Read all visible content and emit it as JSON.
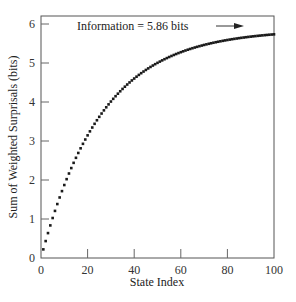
{
  "chart_data": {
    "type": "scatter",
    "title": "",
    "xlabel": "State Index",
    "ylabel": "Sum of Weighted Surprisals (bits)",
    "xlim": [
      0,
      100
    ],
    "ylim": [
      0,
      6.2
    ],
    "xticks": [
      0,
      20,
      40,
      60,
      80,
      100
    ],
    "yticks": [
      0,
      1,
      2,
      3,
      4,
      5,
      6
    ],
    "grid": false,
    "legend": null,
    "annotation": {
      "text": "Information = 5.86 bits",
      "arrow_to": [
        86,
        5.86
      ]
    },
    "series": [
      {
        "name": "cumulative weighted surprisal",
        "model": "5.86*(1-exp(-x/26))",
        "x": [
          1,
          2,
          3,
          4,
          5,
          6,
          7,
          8,
          9,
          10,
          12,
          14,
          16,
          18,
          20,
          25,
          30,
          35,
          40,
          45,
          50,
          55,
          60,
          65,
          70,
          75,
          80,
          85,
          90,
          95,
          100
        ],
        "values": [
          0.22,
          0.43,
          0.64,
          0.84,
          1.03,
          1.21,
          1.39,
          1.56,
          1.73,
          1.88,
          2.18,
          2.45,
          2.7,
          2.93,
          3.14,
          3.61,
          3.99,
          4.31,
          4.6,
          4.8,
          4.97,
          5.12,
          5.24,
          5.34,
          5.42,
          5.49,
          5.55,
          5.6,
          5.64,
          5.68,
          5.71
        ]
      }
    ]
  },
  "labels": {
    "xlabel": "State Index",
    "ylabel": "Sum of Weighted Surprisals (bits)",
    "annotation": "Information = 5.86 bits",
    "xticks": [
      "0",
      "20",
      "40",
      "60",
      "80",
      "100"
    ],
    "yticks": [
      "0",
      "1",
      "2",
      "3",
      "4",
      "5",
      "6"
    ]
  }
}
